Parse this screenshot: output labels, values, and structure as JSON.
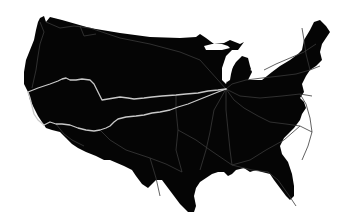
{
  "map": {
    "title": "",
    "region": "contiguous-united-states",
    "colors": {
      "background": "#ffffff",
      "land": "#050505",
      "major_route": "#c8c8c8",
      "minor_route": "#3a3a3a",
      "lake": "#ffffff"
    },
    "major_routes": [
      {
        "name": "northern-transcontinental-route",
        "points": "28,92 38,88 50,84 58,81 62,79 66,78 70,80 76,80 82,79 90,80 94,84 98,92 102,100 108,99 114,98 120,97 128,98 134,99 144,98 152,97 162,96 176,95 186,94 198,93 208,91 218,90 226,89"
      },
      {
        "name": "southern-transcontinental-route",
        "points": "44,125 50,122 56,124 62,124 70,125 78,128 86,130 94,131 100,130 106,128 110,126 114,122 118,119 126,117 136,116 144,115 152,113 160,112 170,110 178,107 188,104 198,100 208,96 218,92 226,89"
      },
      {
        "name": "west-coast-route",
        "points": "28,92 30,98 32,106 34,114 38,120 44,125"
      }
    ],
    "minor_routes": [
      "40,22 44,32 40,44 38,56 36,70 32,88",
      "46,22 60,28 74,26 90,28 120,38 150,44 180,52 200,60 226,89",
      "80,26 84,36 96,34",
      "226,89 232,84 246,80 262,78 280,76 296,74 310,70 320,66",
      "226,89 234,100 244,108 258,116 270,122",
      "226,89 226,110 228,130 230,150 232,165",
      "226,89 214,110 210,132 206,150 200,170",
      "226,89 240,96 260,98 282,96 300,94 312,96",
      "300,94 306,104 310,118 312,132 308,146 302,160",
      "270,122 286,124 300,126 312,132",
      "176,95 176,110 178,130 176,150 182,172",
      "178,130 196,140 210,150 232,165 252,170 268,172",
      "268,172 278,180 288,194 296,206",
      "232,165 250,160 266,150 284,140 300,126",
      "100,130 110,140 126,150 150,158 166,164 182,172",
      "150,158 156,178 160,196",
      "56,124 64,134 72,140 84,146",
      "264,70 276,64 290,58 304,52 316,44",
      "302,28 304,40 306,54 310,70"
    ],
    "hub": {
      "name": "chicago-hub",
      "x": 226,
      "y": 89
    }
  }
}
